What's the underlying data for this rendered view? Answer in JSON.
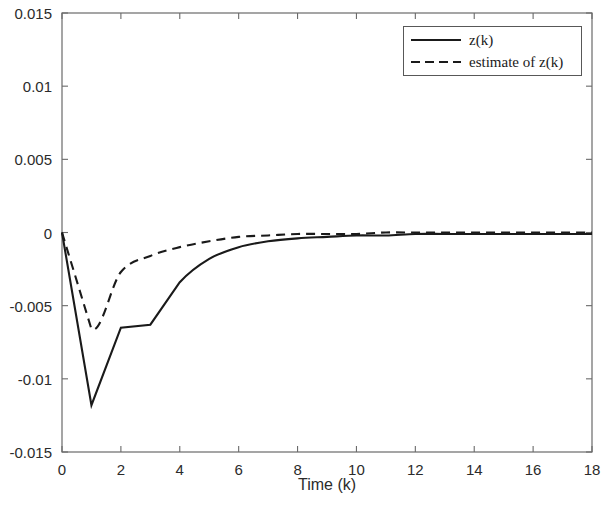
{
  "chart_data": {
    "type": "line",
    "title": "",
    "subtitle": "",
    "xlabel": "Time (k)",
    "ylabel": "",
    "xlim": [
      0,
      18
    ],
    "ylim": [
      -0.015,
      0.015
    ],
    "grid": false,
    "legend_position": "top-right",
    "xticks": [
      0,
      2,
      4,
      6,
      8,
      10,
      12,
      14,
      16,
      18
    ],
    "xtick_labels": [
      "0",
      "2",
      "4",
      "6",
      "8",
      "10",
      "12",
      "14",
      "16",
      "18"
    ],
    "yticks": [
      0.015,
      0.01,
      0.005,
      0,
      -0.005,
      -0.01,
      -0.015
    ],
    "ytick_labels": [
      "0.015",
      "0.01",
      "0.005",
      "0",
      "-0.005",
      "-0.01",
      "-0.015"
    ],
    "series": [
      {
        "name": "z(k)",
        "style": "solid",
        "color": "#1a1a1a",
        "x": [
          0,
          1,
          2,
          3,
          4,
          5,
          6,
          7,
          8,
          9,
          10,
          11,
          12,
          13,
          14,
          15,
          16,
          17,
          18
        ],
        "values": [
          0,
          -0.0118,
          -0.0065,
          -0.0063,
          -0.0034,
          -0.0018,
          -0.001,
          -0.0006,
          -0.0004,
          -0.0003,
          -0.0002,
          -0.0002,
          -0.0001,
          -0.0001,
          -0.0001,
          -0.0001,
          -0.0001,
          -0.0001,
          -0.0001
        ]
      },
      {
        "name": "estimate of z(k)",
        "style": "dashed",
        "color": "#1a1a1a",
        "x": [
          0,
          1,
          2,
          3,
          4,
          5,
          6,
          7,
          8,
          9,
          10,
          11,
          12,
          13,
          14,
          15,
          16,
          17,
          18
        ],
        "values": [
          0,
          -0.0066,
          -0.0027,
          -0.0016,
          -0.001,
          -0.0006,
          -0.0003,
          -0.0002,
          -0.0001,
          -0.0001,
          -0.0001,
          0,
          0,
          0,
          0,
          0,
          0,
          0,
          0
        ]
      }
    ]
  },
  "legend": {
    "entries": [
      {
        "label": "z(k)",
        "style": "solid"
      },
      {
        "label": "estimate of z(k)",
        "style": "dashed"
      }
    ]
  },
  "axes": {
    "x_axis_label": "Time (k)"
  }
}
